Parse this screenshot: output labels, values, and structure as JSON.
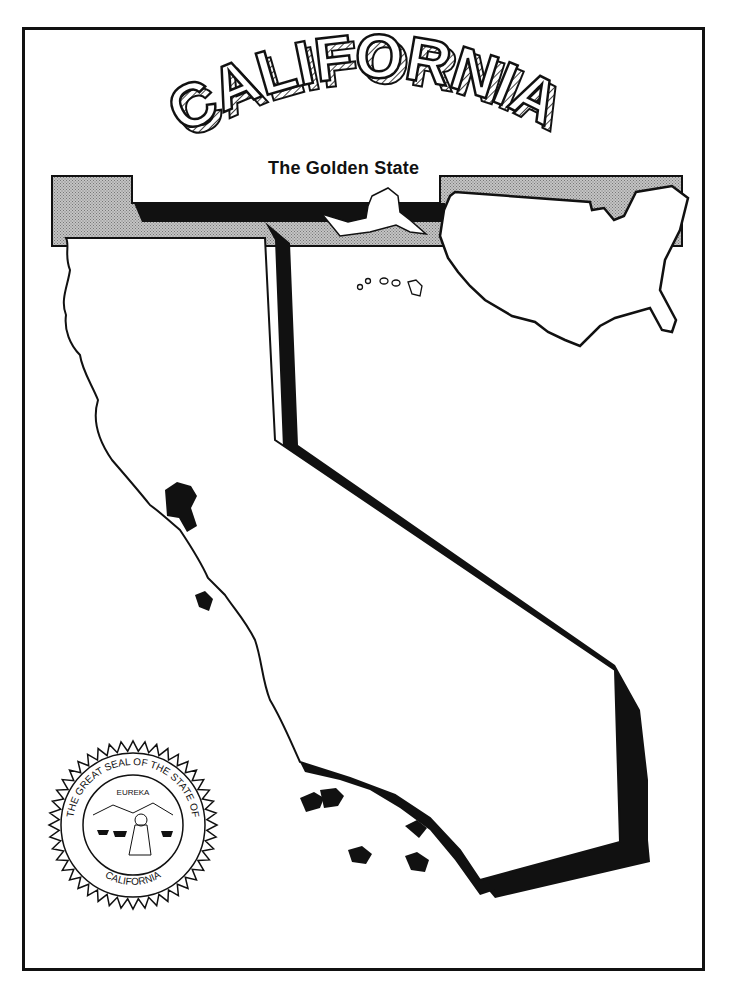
{
  "page": {
    "title": "CALIFORNIA",
    "subtitle": "The Golden State"
  },
  "seal": {
    "outer_text": "THE GREAT SEAL OF THE STATE OF",
    "bottom_text": "CALIFORNIA",
    "motto": "EUREKA"
  },
  "colors": {
    "ink": "#111111",
    "paper": "#ffffff",
    "bar_gray": "#b8b8b8"
  }
}
